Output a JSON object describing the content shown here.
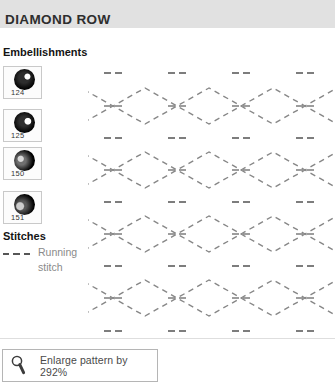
{
  "title": "DIAMOND ROW",
  "embellishments": {
    "heading": "Embellishments",
    "beads": [
      {
        "number": "124",
        "highlight": "white-right"
      },
      {
        "number": "125",
        "highlight": "white-right"
      },
      {
        "number": "150",
        "highlight": "gray-left"
      },
      {
        "number": "151",
        "highlight": "gray-left"
      }
    ]
  },
  "stitches": {
    "heading": "Stitches",
    "items": [
      {
        "label": "Running stitch",
        "swatch": "dashed-line"
      }
    ]
  },
  "footer": {
    "icon": "magnifier-icon",
    "enlarge_label": "Enlarge pattern by 292%"
  },
  "colors": {
    "titlebar_bg": "#e1e1e1",
    "title_text": "#2e2e2e",
    "pattern_dash": "#878787",
    "tick_dash": "#7d7d7d",
    "legend_gray_text": "#8a8a8a",
    "swatch_border": "#c9c9c9"
  },
  "pattern": {
    "type": "diamond-chain-running-stitch",
    "rows": 4,
    "row_junction_y": [
      54,
      118,
      182,
      246
    ],
    "junction_x": [
      -39,
      25,
      89,
      153,
      217,
      281
    ],
    "visible_junction_x": [
      25,
      89,
      153,
      217
    ],
    "diamond_half_width": 32,
    "diamond_half_height": 18,
    "tick_row_y": [
      21,
      86,
      150,
      214,
      279
    ],
    "tick_half_width": 9,
    "edge_dasharray": "5.5 4.5",
    "tick_dasharray": "7 4"
  }
}
